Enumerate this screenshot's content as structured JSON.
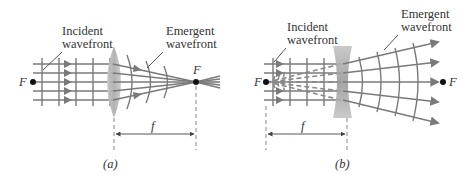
{
  "panel_a": {
    "caption": "(a)",
    "lens_type": "converging",
    "incident_label_1": "Incident",
    "incident_label_2": "wavefront",
    "emergent_label_1": "Emergent",
    "emergent_label_2": "wavefront",
    "focal_left": "F",
    "focal_right": "F",
    "focal_length": "f"
  },
  "panel_b": {
    "caption": "(b)",
    "lens_type": "diverging",
    "incident_label_1": "Incident",
    "incident_label_2": "wavefront",
    "emergent_label_1": "Emergent",
    "emergent_label_2": "wavefront",
    "focal_left": "F",
    "focal_right": "F",
    "focal_length": "f"
  },
  "colors": {
    "ray": "#7a7a7a",
    "lens_fill": "#b8b8b8",
    "text": "#333333"
  }
}
